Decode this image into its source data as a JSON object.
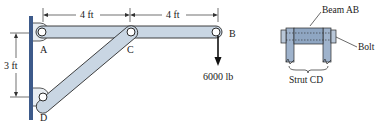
{
  "figure": {
    "labels": {
      "point_a": "A",
      "point_b": "B",
      "point_c": "C",
      "point_d": "D"
    },
    "dimensions": {
      "ac_length": "4 ft",
      "cb_length": "4 ft",
      "ad_height": "3 ft"
    },
    "load": {
      "value": "6000 lb",
      "direction": "down"
    },
    "detail_view": {
      "beam_label": "Beam AB",
      "bolt_label": "Bolt",
      "strut_label": "Strut CD"
    },
    "colors": {
      "wall": "#3d5a8a",
      "member_fill": "#c9d6e3",
      "member_stroke": "#2a2a2a",
      "detail_fill": "#9fb3cc",
      "text": "#1a1a1a"
    }
  }
}
